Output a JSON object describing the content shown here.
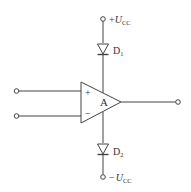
{
  "diagram": {
    "type": "circuit-schematic",
    "components": {
      "opamp": {
        "label": "A",
        "plus_sign": "+",
        "minus_sign": "−"
      },
      "diode_top": {
        "label_main": "D",
        "label_sub": "1"
      },
      "diode_bottom": {
        "label_main": "D",
        "label_sub": "2"
      }
    },
    "terminals": {
      "top": {
        "sign": "+",
        "symbol": "U",
        "subscript": "CC"
      },
      "bottom": {
        "sign": "−",
        "symbol": "U",
        "subscript": "CC"
      },
      "input_noninverting": "",
      "input_inverting": "",
      "output": ""
    },
    "colors": {
      "stroke": "#444444",
      "text": "#333333",
      "background": "#ffffff"
    }
  }
}
